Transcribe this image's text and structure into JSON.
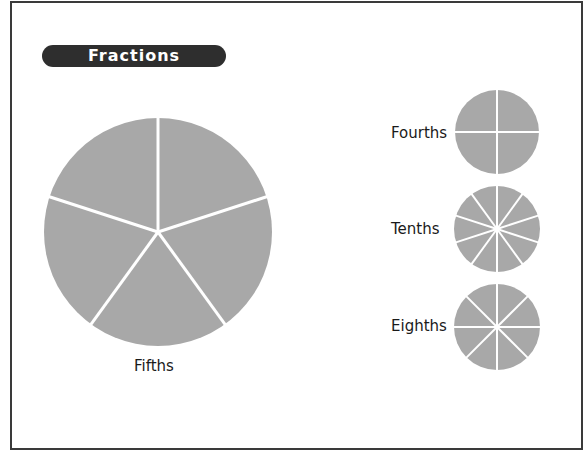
{
  "title": "Fractions",
  "colors": {
    "slice_fill": "#a8a8a8",
    "divider": "#ffffff",
    "frame": "#3a3a3a",
    "title_bg": "#2e2e2e"
  },
  "circles": [
    {
      "id": "fifths",
      "label": "Fifths",
      "parts": 5,
      "cx": 158,
      "cy": 232,
      "r": 114
    },
    {
      "id": "fourths",
      "label": "Fourths",
      "parts": 4,
      "cx": 497,
      "cy": 132,
      "r": 42
    },
    {
      "id": "tenths",
      "label": "Tenths",
      "parts": 10,
      "cx": 497,
      "cy": 229,
      "r": 43
    },
    {
      "id": "eighths",
      "label": "Eighths",
      "parts": 8,
      "cx": 497,
      "cy": 327,
      "r": 43
    }
  ]
}
